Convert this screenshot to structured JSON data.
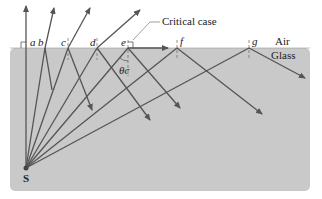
{
  "diagram": {
    "media": {
      "upper": "Air",
      "lower": "Glass"
    },
    "source_label": "S",
    "ray_labels": [
      "a",
      "b",
      "c",
      "d",
      "e",
      "f",
      "g"
    ],
    "critical_label": "Critical case",
    "angle_label": "θc",
    "colors": {
      "glass": "#c8c8c8",
      "ray": "#555555",
      "text": "#222222",
      "background": "#ffffff"
    }
  }
}
